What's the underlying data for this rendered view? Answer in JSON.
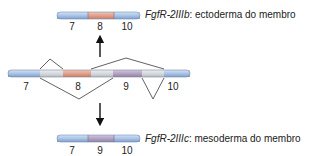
{
  "colors": {
    "exon_blue": "#a9c4e6",
    "exon_blue_edge": "#6e8fb8",
    "exon_salmon": "#e3a08c",
    "exon_salmon_edge": "#b9725e",
    "exon_purple": "#b4a3c4",
    "exon_purple_edge": "#86749a",
    "intron_gray": "#d6d9dd",
    "intron_gray_edge": "#a4a8ae",
    "line": "#333333",
    "text": "#222222"
  },
  "top_isoform": {
    "gene_name": "FgfR-2IIIb",
    "separator": ": ",
    "description": "ectoderma do membro",
    "exons": [
      {
        "label": "7",
        "color": "blue"
      },
      {
        "label": "8",
        "color": "salmon"
      },
      {
        "label": "10",
        "color": "blue"
      }
    ]
  },
  "pre_mrna": {
    "segments": [
      {
        "label": "7",
        "type": "exon",
        "color": "blue"
      },
      {
        "label": "",
        "type": "intron",
        "color": "gray"
      },
      {
        "label": "8",
        "type": "exon",
        "color": "salmon"
      },
      {
        "label": "",
        "type": "intron",
        "color": "gray"
      },
      {
        "label": "9",
        "type": "exon",
        "color": "purple"
      },
      {
        "label": "",
        "type": "intron",
        "color": "gray"
      },
      {
        "label": "10",
        "type": "exon",
        "color": "blue"
      }
    ],
    "splice_paths": [
      {
        "name": "upper-splice-1",
        "position": "above",
        "from_segment": 0,
        "to_segment": 2
      },
      {
        "name": "upper-splice-2",
        "position": "above",
        "from_segment": 2,
        "to_segment": 6
      },
      {
        "name": "lower-splice-1",
        "position": "below",
        "from_segment": 0,
        "to_segment": 4
      },
      {
        "name": "lower-splice-2",
        "position": "below",
        "from_segment": 4,
        "to_segment": 6
      }
    ]
  },
  "bottom_isoform": {
    "gene_name": "FgfR-2IIIc",
    "separator": ": ",
    "description": "mesoderma do membro",
    "exons": [
      {
        "label": "7",
        "color": "blue"
      },
      {
        "label": "9",
        "color": "purple"
      },
      {
        "label": "10",
        "color": "blue"
      }
    ]
  },
  "arrows": [
    {
      "name": "arrow-up-to-IIIb",
      "direction": "up"
    },
    {
      "name": "arrow-down-to-IIIc",
      "direction": "down"
    }
  ]
}
